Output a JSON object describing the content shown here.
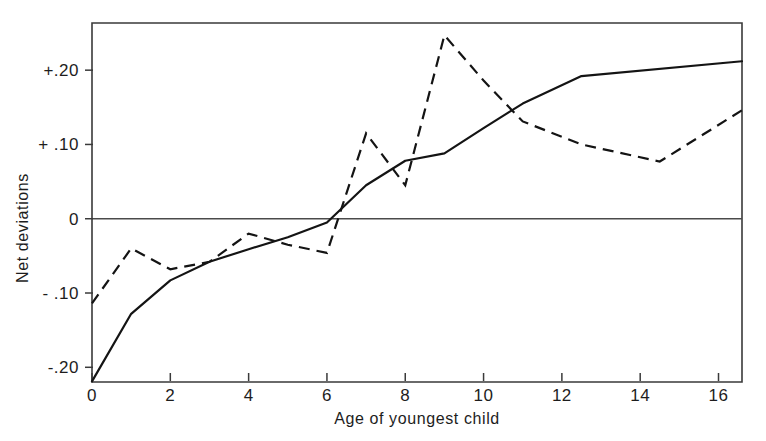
{
  "chart_data": {
    "type": "line",
    "title": "",
    "subtitle": "",
    "xlabel": "Age of youngest child",
    "ylabel": "Net deviations",
    "xlim": [
      0,
      16.6
    ],
    "ylim": [
      -0.22,
      0.275
    ],
    "grid": false,
    "legend": "none",
    "x_ticks": [
      0,
      2,
      4,
      6,
      8,
      10,
      12,
      14,
      16
    ],
    "x_tick_labels": [
      "0",
      "2",
      "4",
      "6",
      "8",
      "10",
      "12",
      "14",
      "16"
    ],
    "y_ticks": [
      0.2,
      0.1,
      0,
      -0.1,
      -0.2
    ],
    "y_tick_labels": [
      "+.20",
      "+ .10",
      "0",
      "- .10",
      "-.20"
    ],
    "zero_reference_line": 0,
    "series": [
      {
        "name": "solid-curve",
        "style": "solid",
        "x": [
          0,
          1,
          2,
          3,
          4,
          5,
          6,
          7,
          8,
          9,
          10,
          11,
          12.5,
          16.6
        ],
        "values": [
          -0.219,
          -0.128,
          -0.083,
          -0.058,
          -0.041,
          -0.025,
          -0.005,
          0.045,
          0.078,
          0.088,
          0.122,
          0.155,
          0.192,
          0.212
        ]
      },
      {
        "name": "dashed-curve",
        "style": "dashed",
        "x": [
          0,
          1,
          2,
          3,
          4,
          5,
          6,
          7,
          8,
          9,
          10,
          11,
          12.5,
          14.5,
          16.6
        ],
        "values": [
          -0.114,
          -0.04,
          -0.068,
          -0.058,
          -0.02,
          -0.035,
          -0.046,
          0.115,
          0.045,
          0.247,
          0.186,
          0.131,
          0.1,
          0.077,
          0.146
        ]
      }
    ]
  },
  "axis": {
    "x_label": "Age of youngest child",
    "y_label": "Net deviations"
  },
  "geometry": {
    "plot_left": 92,
    "plot_right": 742,
    "plot_top": 23,
    "plot_bottom": 382,
    "x_min": 0,
    "x_max": 16.6,
    "y_min": -0.2198,
    "y_max": 0.2635
  }
}
